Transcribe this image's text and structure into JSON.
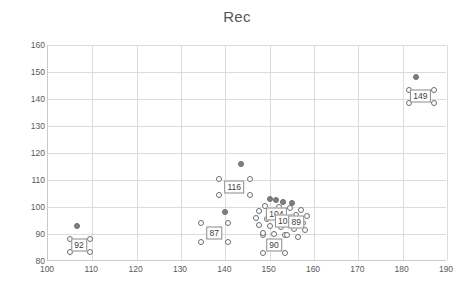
{
  "chart_data": {
    "type": "scatter",
    "title": "Rec",
    "xlabel": "",
    "ylabel": "",
    "xlim": [
      100,
      190
    ],
    "ylim": [
      80,
      160
    ],
    "xticks": [
      100,
      110,
      120,
      130,
      140,
      150,
      160,
      170,
      180,
      190
    ],
    "yticks": [
      80,
      90,
      100,
      110,
      120,
      130,
      140,
      150,
      160
    ],
    "grid": true,
    "legend": false,
    "points": [
      {
        "x": 106.5,
        "y": 93.0,
        "filled": true
      },
      {
        "x": 105.0,
        "y": 88.0,
        "filled": false
      },
      {
        "x": 109.5,
        "y": 88.0,
        "filled": false
      },
      {
        "x": 105.0,
        "y": 83.5,
        "filled": false
      },
      {
        "x": 109.5,
        "y": 83.5,
        "filled": false
      },
      {
        "x": 140.0,
        "y": 98.0,
        "filled": true
      },
      {
        "x": 134.5,
        "y": 94.0,
        "filled": false
      },
      {
        "x": 140.5,
        "y": 94.0,
        "filled": false
      },
      {
        "x": 134.5,
        "y": 87.0,
        "filled": false
      },
      {
        "x": 140.5,
        "y": 87.0,
        "filled": false
      },
      {
        "x": 143.5,
        "y": 116.0,
        "filled": true
      },
      {
        "x": 138.5,
        "y": 110.5,
        "filled": false
      },
      {
        "x": 145.5,
        "y": 110.5,
        "filled": false
      },
      {
        "x": 138.5,
        "y": 104.5,
        "filled": false
      },
      {
        "x": 145.5,
        "y": 104.5,
        "filled": false
      },
      {
        "x": 148.5,
        "y": 89.5,
        "filled": false
      },
      {
        "x": 153.5,
        "y": 89.5,
        "filled": false
      },
      {
        "x": 148.5,
        "y": 83.0,
        "filled": false
      },
      {
        "x": 153.5,
        "y": 83.0,
        "filled": false
      },
      {
        "x": 150.0,
        "y": 103.0,
        "filled": true
      },
      {
        "x": 151.5,
        "y": 102.5,
        "filled": true
      },
      {
        "x": 153.0,
        "y": 102.0,
        "filled": true
      },
      {
        "x": 155.0,
        "y": 101.5,
        "filled": true
      },
      {
        "x": 149.0,
        "y": 100.5,
        "filled": false
      },
      {
        "x": 152.0,
        "y": 100.0,
        "filled": false
      },
      {
        "x": 154.5,
        "y": 99.5,
        "filled": false
      },
      {
        "x": 157.0,
        "y": 99.0,
        "filled": false
      },
      {
        "x": 147.5,
        "y": 98.5,
        "filled": false
      },
      {
        "x": 150.5,
        "y": 98.0,
        "filled": false
      },
      {
        "x": 153.0,
        "y": 97.5,
        "filled": false
      },
      {
        "x": 156.0,
        "y": 97.0,
        "filled": false
      },
      {
        "x": 158.5,
        "y": 96.5,
        "filled": false
      },
      {
        "x": 147.0,
        "y": 96.0,
        "filled": false
      },
      {
        "x": 149.5,
        "y": 95.5,
        "filled": false
      },
      {
        "x": 152.5,
        "y": 95.0,
        "filled": false
      },
      {
        "x": 155.0,
        "y": 94.5,
        "filled": false
      },
      {
        "x": 157.5,
        "y": 94.0,
        "filled": false
      },
      {
        "x": 147.5,
        "y": 93.5,
        "filled": false
      },
      {
        "x": 150.0,
        "y": 93.0,
        "filled": false
      },
      {
        "x": 152.5,
        "y": 92.5,
        "filled": false
      },
      {
        "x": 155.5,
        "y": 92.0,
        "filled": false
      },
      {
        "x": 158.0,
        "y": 91.5,
        "filled": false
      },
      {
        "x": 148.5,
        "y": 90.5,
        "filled": false
      },
      {
        "x": 151.0,
        "y": 90.0,
        "filled": false
      },
      {
        "x": 154.0,
        "y": 89.5,
        "filled": false
      },
      {
        "x": 156.5,
        "y": 89.0,
        "filled": false
      },
      {
        "x": 183.0,
        "y": 148.0,
        "filled": true
      },
      {
        "x": 181.5,
        "y": 143.5,
        "filled": false
      },
      {
        "x": 187.0,
        "y": 143.5,
        "filled": false
      },
      {
        "x": 181.5,
        "y": 138.5,
        "filled": false
      },
      {
        "x": 187.0,
        "y": 138.5,
        "filled": false
      }
    ],
    "labels": [
      {
        "text": "92",
        "x": 107.0,
        "y": 86.0
      },
      {
        "text": "149",
        "x": 184.0,
        "y": 141.0
      },
      {
        "text": "116",
        "x": 142.0,
        "y": 107.5
      },
      {
        "text": "87",
        "x": 137.5,
        "y": 90.5
      },
      {
        "text": "90",
        "x": 151.0,
        "y": 86.0
      },
      {
        "text": "104",
        "x": 151.5,
        "y": 97.5
      },
      {
        "text": "103",
        "x": 153.5,
        "y": 95.0
      },
      {
        "text": "89",
        "x": 156.0,
        "y": 94.5
      }
    ]
  }
}
